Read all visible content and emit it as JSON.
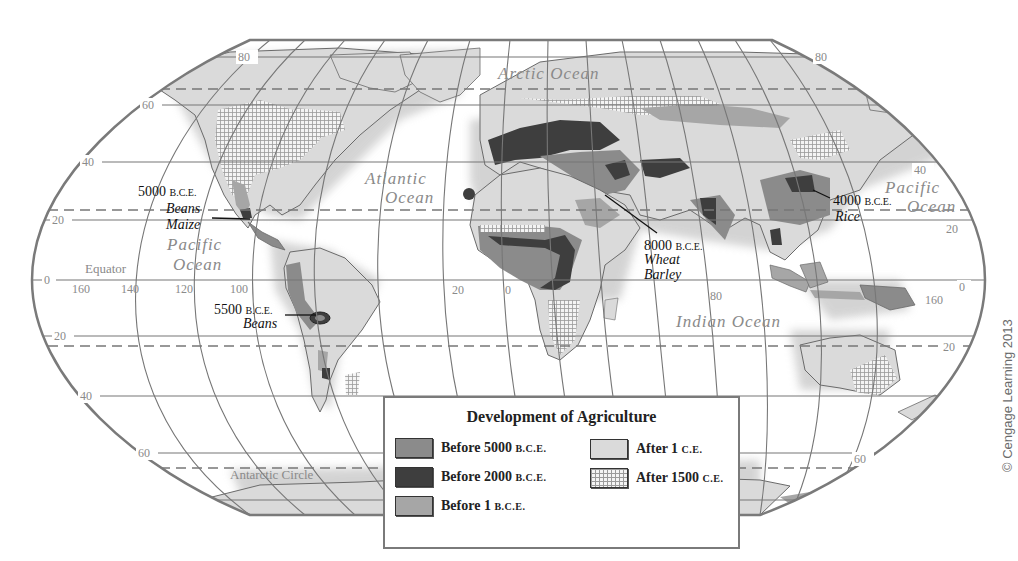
{
  "map": {
    "title": "Development of Agriculture",
    "latitude_labels": {
      "n80_left": "80",
      "n80_right": "80",
      "n60_left": "60",
      "n40_left": "40",
      "n40_right": "40",
      "n20_left": "20",
      "n20_right": "20",
      "eq_left": "0",
      "eq_right": "0",
      "s20_left": "20",
      "s20_right": "20",
      "s40_left": "40",
      "s60_left": "60",
      "s60_right": "60"
    },
    "longitude_labels": [
      "160",
      "140",
      "120",
      "100",
      "20",
      "0",
      "80",
      "160"
    ],
    "line_labels": {
      "equator": "Equator",
      "antarctic_circle": "Antarctic Circle"
    },
    "oceans": {
      "arctic": "Arctic Ocean",
      "atlantic_1": "Atlantic",
      "atlantic_2": "Ocean",
      "pacific_west_1": "Pacific",
      "pacific_west_2": "Ocean",
      "pacific_east_1": "Pacific",
      "pacific_east_2": "Ocean",
      "indian": "Indian Ocean"
    },
    "callouts": [
      {
        "date": "5000",
        "era": "B.C.E.",
        "crops": [
          "Beans",
          "Maize"
        ],
        "region": "Mesoamerica"
      },
      {
        "date": "5500",
        "era": "B.C.E.",
        "crops": [
          "Beans"
        ],
        "region": "Andes"
      },
      {
        "date": "8000",
        "era": "B.C.E.",
        "crops": [
          "Wheat",
          "Barley"
        ],
        "region": "Fertile Crescent"
      },
      {
        "date": "4000",
        "era": "B.C.E.",
        "crops": [
          "Rice"
        ],
        "region": "China"
      }
    ]
  },
  "legend": {
    "title": "Development of Agriculture",
    "items": [
      {
        "label": "Before 5000",
        "era": "B.C.E.",
        "color": "#8b8b8b",
        "pattern": "solid"
      },
      {
        "label": "Before 2000",
        "era": "B.C.E.",
        "color": "#3e3e3e",
        "pattern": "solid"
      },
      {
        "label": "Before 1",
        "era": "B.C.E.",
        "color": "#a6a6a6",
        "pattern": "solid"
      },
      {
        "label": "After 1",
        "era": "C.E.",
        "color": "#dadada",
        "pattern": "solid"
      },
      {
        "label": "After 1500",
        "era": "C.E.",
        "color": "#f4f4f4",
        "pattern": "grid-hatch"
      }
    ]
  },
  "credit": "© Cengage Learning 2013"
}
